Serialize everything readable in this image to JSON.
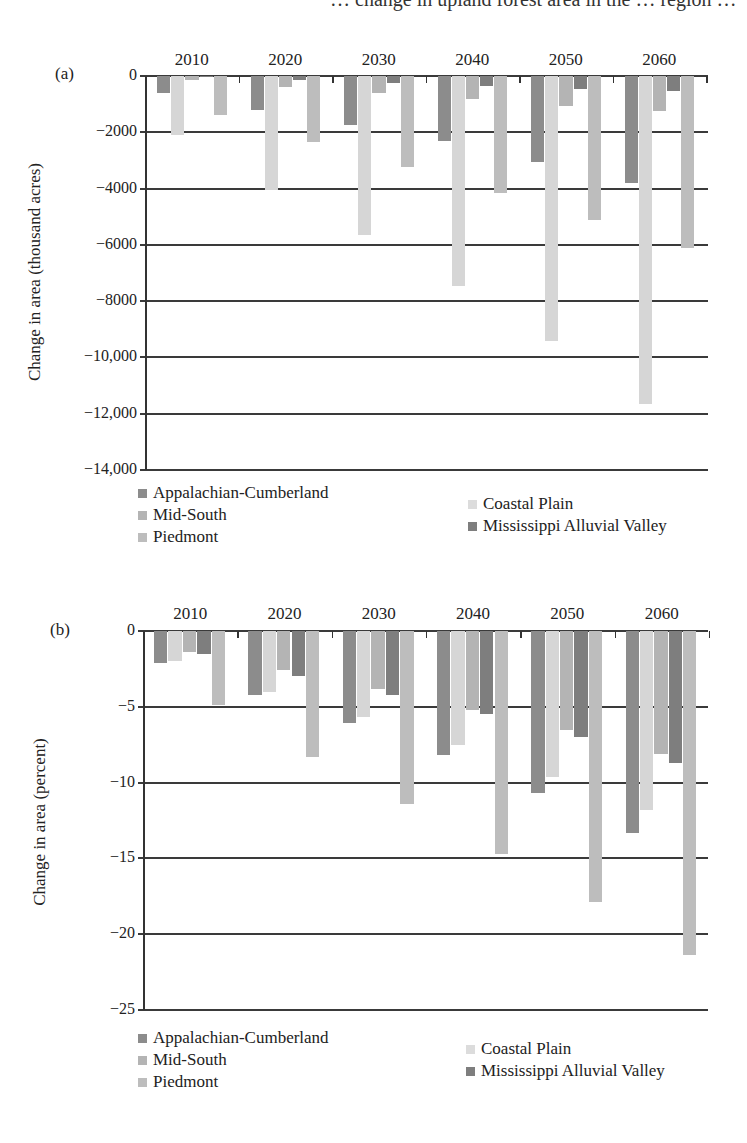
{
  "page": {
    "cutoff_text": "… change in upland forest area in the … region …"
  },
  "chart_data": [
    {
      "type": "bar",
      "panel_label": "(a)",
      "title": "",
      "xlabel": "",
      "ylabel": "Change in area (thousand acres)",
      "categories": [
        "2010",
        "2020",
        "2030",
        "2040",
        "2050",
        "2060"
      ],
      "yticks": [
        0,
        -2000,
        -4000,
        -6000,
        -8000,
        -10000,
        -12000,
        -14000
      ],
      "ytick_labels": [
        "0",
        "-2000",
        "-4000",
        "-6000",
        "-8000",
        "-10,000",
        "-12,000",
        "-14,000"
      ],
      "ylim": [
        -14000,
        0
      ],
      "grid": true,
      "legend_position": "bottom",
      "series": [
        {
          "name": "Appalachian-Cumberland",
          "color": "#8c8c8c",
          "values": [
            -600,
            -1200,
            -1750,
            -2300,
            -3050,
            -3800
          ]
        },
        {
          "name": "Coastal Plain",
          "color": "#d6d6d6",
          "values": [
            -2100,
            -4050,
            -5650,
            -7450,
            -9400,
            -11650
          ]
        },
        {
          "name": "Mid-South",
          "color": "#b4b4b4",
          "values": [
            -150,
            -400,
            -600,
            -800,
            -1050,
            -1250
          ]
        },
        {
          "name": "Mississippi Alluvial Valley",
          "color": "#7e7e7e",
          "values": [
            -30,
            -150,
            -250,
            -350,
            -450,
            -550
          ]
        },
        {
          "name": "Piedmont",
          "color": "#bdbdbd",
          "values": [
            -1400,
            -2350,
            -3250,
            -4150,
            -5100,
            -6100
          ]
        }
      ]
    },
    {
      "type": "bar",
      "panel_label": "(b)",
      "title": "",
      "xlabel": "",
      "ylabel": "Change in area (percent)",
      "categories": [
        "2010",
        "2020",
        "2030",
        "2040",
        "2050",
        "2060"
      ],
      "yticks": [
        0,
        -5,
        -10,
        -15,
        -20,
        -25
      ],
      "ytick_labels": [
        "0",
        "-5",
        "-10",
        "-15",
        "-20",
        "-25"
      ],
      "ylim": [
        -25,
        0
      ],
      "grid": true,
      "legend_position": "bottom",
      "series": [
        {
          "name": "Appalachian-Cumberland",
          "color": "#8c8c8c",
          "values": [
            -2.1,
            -4.2,
            -6.1,
            -8.2,
            -10.7,
            -13.3
          ]
        },
        {
          "name": "Coastal Plain",
          "color": "#d6d6d6",
          "values": [
            -2.0,
            -4.0,
            -5.7,
            -7.5,
            -9.6,
            -11.8
          ]
        },
        {
          "name": "Mid-South",
          "color": "#b4b4b4",
          "values": [
            -1.4,
            -2.6,
            -3.8,
            -5.2,
            -6.5,
            -8.1
          ]
        },
        {
          "name": "Mississippi Alluvial Valley",
          "color": "#7e7e7e",
          "values": [
            -1.5,
            -3.0,
            -4.2,
            -5.5,
            -7.0,
            -8.7
          ]
        },
        {
          "name": "Piedmont",
          "color": "#bdbdbd",
          "values": [
            -4.9,
            -8.3,
            -11.4,
            -14.7,
            -17.9,
            -21.4
          ]
        }
      ]
    }
  ],
  "legends": [
    {
      "items": [
        {
          "label": "Appalachian-Cumberland",
          "color": "#8c8c8c"
        },
        {
          "label": "Coastal Plain",
          "color": "#dcdcdc"
        },
        {
          "label": "Mid-South",
          "color": "#b4b4b4"
        },
        {
          "label": "Mississippi Alluvial Valley",
          "color": "#7e7e7e"
        },
        {
          "label": "Piedmont",
          "color": "#bdbdbd"
        }
      ]
    },
    {
      "items": [
        {
          "label": "Appalachian-Cumberland",
          "color": "#8c8c8c"
        },
        {
          "label": "Coastal Plain",
          "color": "#dcdcdc"
        },
        {
          "label": "Mid-South",
          "color": "#b4b4b4"
        },
        {
          "label": "Mississippi Alluvial Valley",
          "color": "#7e7e7e"
        },
        {
          "label": "Piedmont",
          "color": "#bdbdbd"
        }
      ]
    }
  ]
}
